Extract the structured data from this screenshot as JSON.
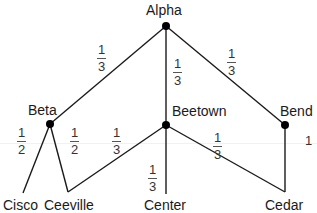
{
  "diagram": {
    "type": "probability-tree",
    "nodes": [
      {
        "id": "alpha",
        "label": "Alpha",
        "x": 166,
        "y": 26,
        "dot": true
      },
      {
        "id": "beta",
        "label": "Beta",
        "x": 50,
        "y": 124,
        "dot": true
      },
      {
        "id": "beetown",
        "label": "Beetown",
        "x": 166,
        "y": 125,
        "dot": true
      },
      {
        "id": "bend",
        "label": "Bend",
        "x": 285,
        "y": 125,
        "dot": true
      },
      {
        "id": "cisco",
        "label": "Cisco",
        "x": 23,
        "y": 193,
        "dot": false
      },
      {
        "id": "ceeville",
        "label": "Ceeville",
        "x": 68,
        "y": 192,
        "dot": false
      },
      {
        "id": "center",
        "label": "Center",
        "x": 166,
        "y": 194,
        "dot": false
      },
      {
        "id": "cedar",
        "label": "Cedar",
        "x": 285,
        "y": 192,
        "dot": false
      }
    ],
    "edges": [
      {
        "from": "alpha",
        "to": "beta",
        "weight": "1/3"
      },
      {
        "from": "alpha",
        "to": "beetown",
        "weight": "1/3"
      },
      {
        "from": "alpha",
        "to": "bend",
        "weight": "1/3"
      },
      {
        "from": "beta",
        "to": "cisco",
        "weight": "1/2"
      },
      {
        "from": "beta",
        "to": "ceeville",
        "weight": "1/2"
      },
      {
        "from": "beetown",
        "to": "ceeville",
        "weight": "1/3"
      },
      {
        "from": "beetown",
        "to": "center",
        "weight": "1/3"
      },
      {
        "from": "beetown",
        "to": "cedar",
        "weight": "1/3"
      },
      {
        "from": "bend",
        "to": "cedar",
        "weight": "1"
      }
    ]
  },
  "labels": {
    "alpha": "Alpha",
    "beta": "Beta",
    "beetown": "Beetown",
    "bend": "Bend",
    "cisco": "Cisco",
    "ceeville": "Ceeville",
    "center": "Center",
    "cedar": "Cedar"
  },
  "weights": {
    "alpha_beta": {
      "num": "1",
      "den": "3"
    },
    "alpha_beetown": {
      "num": "1",
      "den": "3"
    },
    "alpha_bend": {
      "num": "1",
      "den": "3"
    },
    "beta_cisco": {
      "num": "1",
      "den": "2"
    },
    "beta_ceeville": {
      "num": "1",
      "den": "2"
    },
    "beetown_ceeville": {
      "num": "1",
      "den": "3"
    },
    "beetown_center": {
      "num": "1",
      "den": "3"
    },
    "beetown_cedar": {
      "num": "1",
      "den": "3"
    },
    "bend_cedar": "1"
  },
  "colors": {
    "line": "#1a1a1a",
    "node": "#000000",
    "text": "#1a1a1a"
  }
}
